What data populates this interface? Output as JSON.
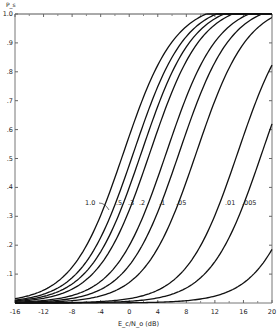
{
  "chart_data": {
    "type": "line",
    "title": "",
    "xlabel": "E_c/N_o (dB)",
    "ylabel": "P_s",
    "xlim": [
      -16,
      20
    ],
    "ylim": [
      0,
      1.0
    ],
    "xticks": [
      -16,
      -12,
      -8,
      -4,
      0,
      4,
      8,
      12,
      16,
      20
    ],
    "xtick_labels": [
      "-16",
      "-12",
      "-8",
      "-4",
      "0",
      "4",
      "8",
      "12",
      "16",
      "20"
    ],
    "yticks": [
      0.1,
      0.2,
      0.3,
      0.4,
      0.5,
      0.6,
      0.7,
      0.8,
      0.9,
      1.0
    ],
    "ytick_labels": [
      ".1",
      ".2",
      ".3",
      ".4",
      ".5",
      ".6",
      ".7",
      ".8",
      ".9",
      "1.0"
    ],
    "grid": false,
    "legend": "inline labels on curves",
    "series": [
      {
        "name": "1.0",
        "mid": -0.8,
        "width": 3.6
      },
      {
        "name": ".5",
        "mid": 0.6,
        "width": 3.6
      },
      {
        "name": ".3",
        "mid": 1.7,
        "width": 3.6
      },
      {
        "name": ".2",
        "mid": 2.9,
        "width": 3.6
      },
      {
        "name": ".1",
        "mid": 5.2,
        "width": 3.6
      },
      {
        "name": ".05",
        "mid": 7.0,
        "width": 3.6
      },
      {
        "name": "",
        "mid": 9.4,
        "width": 3.6
      },
      {
        "name": ".01",
        "mid": 15.2,
        "width": 3.6
      },
      {
        "name": ".005",
        "mid": 18.6,
        "width": 3.6
      },
      {
        "name": "",
        "mid": 25.5,
        "width": 3.6
      }
    ],
    "labels": [
      {
        "text": "1.0",
        "x": 85,
        "y": 205
      },
      {
        "text": ".5",
        "x": 116,
        "y": 205
      },
      {
        "text": ".3",
        "x": 128,
        "y": 205
      },
      {
        "text": ".2",
        "x": 139,
        "y": 205
      },
      {
        "text": ".1",
        "x": 159,
        "y": 205
      },
      {
        "text": ".05",
        "x": 176,
        "y": 205
      },
      {
        "text": ".01",
        "x": 225,
        "y": 205
      },
      {
        "text": ".005",
        "x": 242,
        "y": 205
      }
    ]
  }
}
